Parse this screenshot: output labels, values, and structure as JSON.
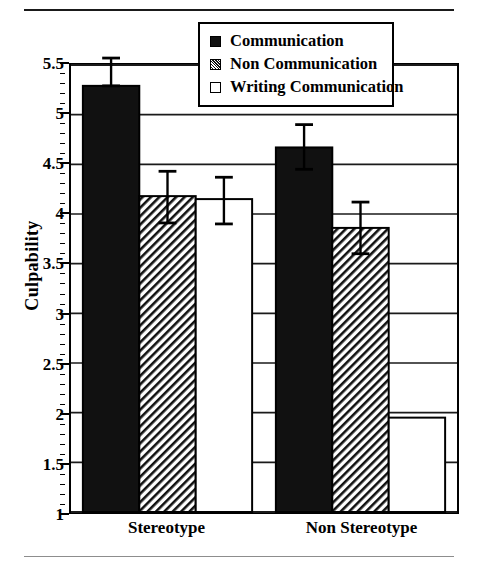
{
  "chart_data": {
    "type": "bar",
    "title": "",
    "xlabel": "",
    "ylabel": "Culpability",
    "categories": [
      "Stereotype",
      "Non Stereotype"
    ],
    "ylim": [
      1,
      5.5
    ],
    "ytick_labels": [
      "1",
      "1.5",
      "2",
      "2.5",
      "3",
      "3.5",
      "4",
      "4.5",
      "5",
      "5.5"
    ],
    "ytick_values": [
      1,
      1.5,
      2,
      2.5,
      3,
      3.5,
      4,
      4.5,
      5,
      5.5
    ],
    "ytick_minor_step": 0.1,
    "grid": "horizontal",
    "legend_position": "top-center",
    "series": [
      {
        "name": "Communication",
        "fill": "solid-black",
        "color": "#111111",
        "values": [
          5.29,
          4.67
        ],
        "errors_upper": [
          5.57,
          4.9
        ],
        "errors_lower": [
          5.29,
          4.45
        ]
      },
      {
        "name": "Non Communication",
        "fill": "diagonal-hatch",
        "color": "#111111",
        "values": [
          4.18,
          3.86
        ],
        "errors_upper": [
          4.43,
          4.12
        ],
        "errors_lower": [
          3.91,
          3.6
        ]
      },
      {
        "name": "Writing Communication",
        "fill": "open-white",
        "color": "#ffffff",
        "values": [
          4.15,
          1.95
        ],
        "errors_upper": [
          4.37,
          1.95
        ],
        "errors_lower": [
          3.9,
          1.95
        ]
      }
    ]
  },
  "legend": {
    "items": [
      {
        "label": "Communication",
        "swatch": "solid-square-icon"
      },
      {
        "label": "Non Communication",
        "swatch": "hatched-square-icon"
      },
      {
        "label": "Writing Communication",
        "swatch": "open-square-icon"
      }
    ]
  },
  "axes": {
    "y_title": "Culpability",
    "y_labels": [
      "5.5",
      "5",
      "4.5",
      "4",
      "3.5",
      "3",
      "2.5",
      "2",
      "1.5",
      "1"
    ],
    "x_labels": [
      "Stereotype",
      "Non Stereotype"
    ]
  },
  "colors": {
    "ink": "#000000",
    "bar_solid": "#111111",
    "bar_open": "#ffffff",
    "grid": "#1a1a1a",
    "rule_bottom": "#8d8d8d"
  }
}
